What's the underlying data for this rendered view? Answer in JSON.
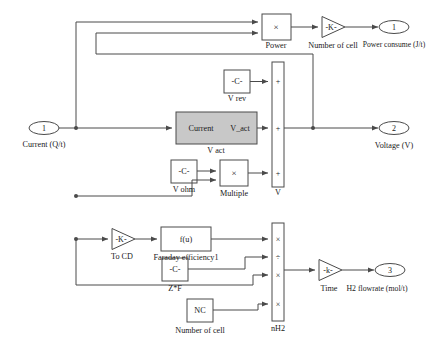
{
  "diagram": {
    "stroke": "#4a4a4a",
    "fill_plain": "#ffffff",
    "fill_subsystem": "#c8c8c8",
    "text_color": "#1a1a1a"
  },
  "inports": [
    {
      "id": "in1",
      "number": "1",
      "label": "Current (Q/t)"
    }
  ],
  "outports": [
    {
      "id": "out1",
      "number": "1",
      "label": "Power consume (J/t)"
    },
    {
      "id": "out2",
      "number": "2",
      "label": "Voltage (V)"
    },
    {
      "id": "out3",
      "number": "3",
      "label": "H2 flowrate (mol/t)"
    }
  ],
  "blocks": {
    "power": {
      "symbol": "×",
      "label": "Power",
      "type": "product"
    },
    "number_of_cell_gain": {
      "symbol": "-K-",
      "label": "Number of cell",
      "type": "gain"
    },
    "v_rev": {
      "symbol": "-C-",
      "label": "V rev",
      "type": "constant"
    },
    "v_act": {
      "in_label": "Current",
      "out_label": "V_act",
      "label": "V act",
      "type": "subsystem"
    },
    "v_ohm": {
      "symbol": "-C-",
      "label": "V ohm",
      "type": "constant"
    },
    "multiple": {
      "symbol": "×",
      "label": "Multiple",
      "type": "product"
    },
    "v_sum": {
      "label": "V",
      "type": "sum",
      "signs": [
        "+",
        "+",
        "+"
      ]
    },
    "to_cd": {
      "symbol": "-K-",
      "label": "To CD",
      "type": "gain"
    },
    "faraday": {
      "symbol": "f(u)",
      "label": "Faraday efficiency1",
      "type": "fcn"
    },
    "zf": {
      "symbol": "-C-",
      "label": "Z*F",
      "type": "constant"
    },
    "nc": {
      "symbol": "NC",
      "label": "Number of cell",
      "type": "constant"
    },
    "nh2": {
      "label": "nH2",
      "type": "product",
      "signs": [
        "×",
        "÷",
        "×",
        "×"
      ]
    },
    "time": {
      "symbol": "-k-",
      "label": "Time",
      "type": "gain"
    }
  }
}
